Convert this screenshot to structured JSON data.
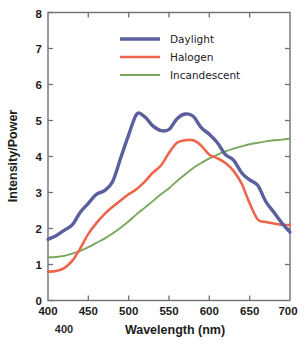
{
  "chart_data": {
    "type": "line",
    "title": "",
    "xlabel": "Wavelength (nm)",
    "ylabel": "Intensity/Power",
    "xlim": [
      400,
      700
    ],
    "ylim": [
      0,
      8
    ],
    "xticks": [
      400,
      450,
      500,
      550,
      600,
      650,
      700
    ],
    "yticks": [
      0,
      1,
      2,
      3,
      4,
      5,
      6,
      7,
      8
    ],
    "xtick_labels": [
      "400",
      "450",
      "500",
      "550",
      "600",
      "650",
      "700"
    ],
    "ytick_labels": [
      "0",
      "1",
      "2",
      "3",
      "4",
      "5",
      "6",
      "7",
      "8"
    ],
    "grid": false,
    "legend_position": "top-center",
    "x": [
      400,
      410,
      420,
      430,
      440,
      450,
      460,
      470,
      480,
      490,
      500,
      510,
      520,
      530,
      540,
      550,
      560,
      570,
      580,
      590,
      600,
      610,
      620,
      630,
      640,
      650,
      660,
      670,
      680,
      690,
      700
    ],
    "series": [
      {
        "name": "Daylight",
        "color": "#5b5f9e",
        "values": [
          1.7,
          1.8,
          1.95,
          2.1,
          2.45,
          2.7,
          2.95,
          3.05,
          3.3,
          3.95,
          4.6,
          5.18,
          5.1,
          4.85,
          4.72,
          4.75,
          5.05,
          5.18,
          5.12,
          4.8,
          4.62,
          4.38,
          4.05,
          3.9,
          3.55,
          3.35,
          3.2,
          2.75,
          2.45,
          2.15,
          1.9
        ]
      },
      {
        "name": "Halogen",
        "color": "#ef654c",
        "values": [
          0.8,
          0.82,
          0.9,
          1.1,
          1.45,
          1.85,
          2.15,
          2.4,
          2.6,
          2.78,
          2.95,
          3.1,
          3.3,
          3.55,
          3.75,
          4.1,
          4.38,
          4.45,
          4.45,
          4.3,
          4.05,
          3.95,
          3.82,
          3.6,
          3.25,
          2.7,
          2.25,
          2.18,
          2.14,
          2.1,
          2.1
        ]
      },
      {
        "name": "Incandescent",
        "color": "#79a85c",
        "values": [
          1.2,
          1.21,
          1.24,
          1.3,
          1.38,
          1.48,
          1.6,
          1.72,
          1.86,
          2.02,
          2.2,
          2.4,
          2.58,
          2.76,
          2.95,
          3.12,
          3.32,
          3.5,
          3.68,
          3.82,
          3.95,
          4.05,
          4.14,
          4.22,
          4.28,
          4.34,
          4.38,
          4.42,
          4.45,
          4.47,
          4.5
        ]
      }
    ],
    "annotations": [
      {
        "text": "400",
        "kind": "stray-duplicate-xtick"
      }
    ]
  },
  "legend": {
    "items": [
      {
        "label": "Daylight",
        "color": "#5b5f9e"
      },
      {
        "label": "Halogen",
        "color": "#ef654c"
      },
      {
        "label": "Incandescent",
        "color": "#79a85c"
      }
    ]
  },
  "axes": {
    "y_title": "Intensity/Power",
    "x_title": "Wavelength (nm)"
  }
}
